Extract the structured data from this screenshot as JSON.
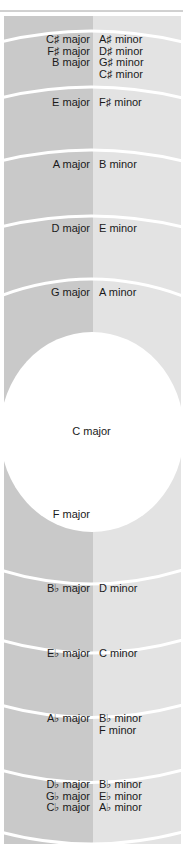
{
  "colors": {
    "major_column": "#c9c9c9",
    "minor_column": "#e3e3e3",
    "separator": "#ffffff",
    "top_rule": "#8a8a8a",
    "text": "#1a1a1a"
  },
  "center_key": "C major",
  "sharp_side": [
    {
      "major": [
        "C♯ major",
        "F♯ major",
        "B major"
      ],
      "minor": [
        "A♯ minor",
        "D♯ minor",
        "G♯ minor",
        "C♯ minor"
      ]
    },
    {
      "major": [
        "E major"
      ],
      "minor": [
        "F♯ minor"
      ]
    },
    {
      "major": [
        "A major"
      ],
      "minor": [
        "B minor"
      ]
    },
    {
      "major": [
        "D major"
      ],
      "minor": [
        "E minor"
      ]
    },
    {
      "major": [
        "G major"
      ],
      "minor": [
        "A minor"
      ]
    }
  ],
  "flat_side": [
    {
      "major": [
        "F major"
      ],
      "minor": []
    },
    {
      "major": [
        "B♭ major"
      ],
      "minor": [
        "D minor"
      ]
    },
    {
      "major": [
        "E♭ major"
      ],
      "minor": [
        "C minor"
      ]
    },
    {
      "major": [
        "A♭ major"
      ],
      "minor": [
        "B♭ minor",
        "F minor"
      ]
    },
    {
      "major": [
        "D♭ major",
        "G♭ major",
        "C♭ major"
      ],
      "minor": [
        "B♭ minor",
        "E♭ minor",
        "A♭ minor"
      ]
    }
  ]
}
